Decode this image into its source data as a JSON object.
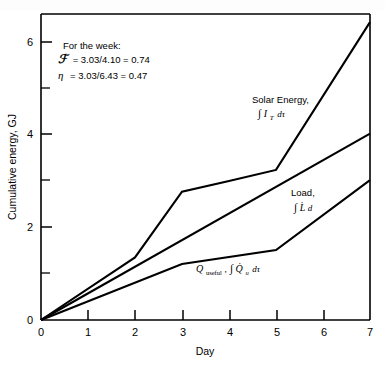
{
  "chart_data": {
    "type": "line",
    "title": "",
    "xlabel": "Day",
    "ylabel": "Cumulative energy, GJ",
    "xlim": [
      0,
      7
    ],
    "ylim": [
      0,
      6.6
    ],
    "grid": false,
    "legend_position": "inline-labels",
    "x_ticks": [
      "0",
      "1",
      "2",
      "3",
      "4",
      "5",
      "6",
      "7"
    ],
    "x_tick_values": [
      0,
      1,
      2,
      3,
      4,
      5,
      6,
      7
    ],
    "y_ticks": [
      "0",
      "2",
      "4",
      "6"
    ],
    "y_tick_values": [
      0,
      2,
      4,
      6
    ],
    "y_minor_tick_values": [
      1,
      3,
      5
    ],
    "series": [
      {
        "name": "Solar Energy",
        "label_line1": "Solar Energy,",
        "label_line2_integral": "∫",
        "label_line2_var": "I",
        "label_line2_sub": "T",
        "label_line2_tail": "dτ",
        "x": [
          0,
          2,
          3,
          4,
          5,
          7
        ],
        "values": [
          0,
          1.35,
          2.77,
          3.0,
          3.24,
          6.43
        ],
        "color": "#000000"
      },
      {
        "name": "Load",
        "label_line1": "Load,",
        "label_line2_integral": "∫",
        "label_line2_var": "L̇",
        "label_line2_sub": "",
        "label_line2_tail": "d",
        "x": [
          0,
          7
        ],
        "values": [
          0,
          4.02
        ],
        "color": "#000000"
      },
      {
        "name": "Q useful",
        "label_prefix_var": "Q",
        "label_prefix_sub": "useful",
        "label_sep": ", ",
        "label_line2_integral": "∫",
        "label_line2_var": "Q̇",
        "label_line2_sub": "u",
        "label_line2_tail": "dτ",
        "x": [
          0,
          3,
          5,
          7
        ],
        "values": [
          0,
          1.21,
          1.51,
          3.02
        ],
        "color": "#000000"
      }
    ],
    "annotations": [
      {
        "id": "heading",
        "text": "For the week:"
      },
      {
        "id": "solar-fraction",
        "symbol": "ℱ",
        "equation": "= 3.03/4.10 = 0.74",
        "numerator": 3.03,
        "denominator": 4.1,
        "result": 0.74
      },
      {
        "id": "efficiency",
        "symbol": "η",
        "equation": "= 3.03/6.43 = 0.47",
        "numerator": 3.03,
        "denominator": 6.43,
        "result": 0.47
      }
    ]
  }
}
